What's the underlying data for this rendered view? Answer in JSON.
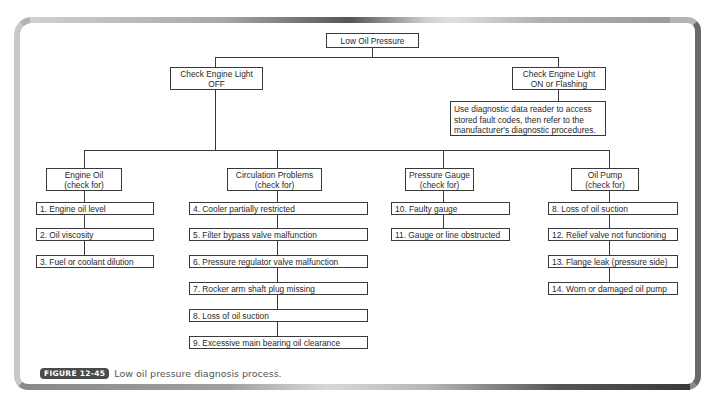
{
  "diagram": {
    "root": {
      "label": "Low Oil Pressure"
    },
    "branch_off": {
      "line1": "Check Engine Light",
      "line2": "OFF"
    },
    "branch_on": {
      "line1": "Check Engine Light",
      "line2": "ON or Flashing"
    },
    "diagnostic_note": {
      "line1": "Use diagnostic data reader to access",
      "line2": "stored fault codes, then refer to the",
      "line3": "manufacturer's diagnostic procedures."
    },
    "categories": [
      {
        "title": "Engine Oil",
        "subtitle": "(check for)",
        "items": [
          "1. Engine oil level",
          "2. Oil viscosity",
          "3. Fuel or coolant dilution"
        ]
      },
      {
        "title": "Circulation Problems",
        "subtitle": "(check for)",
        "items": [
          "4. Cooler partially restricted",
          "5. Filter bypass valve malfunction",
          "6. Pressure regulator valve malfunction",
          "7. Rocker arm shaft plug missing",
          "8. Loss of oil suction",
          "9. Excessive main bearing oil clearance"
        ]
      },
      {
        "title": "Pressure Gauge",
        "subtitle": "(check for)",
        "items": [
          "10. Faulty gauge",
          "11. Gauge or line obstructed"
        ]
      },
      {
        "title": "Oil Pump",
        "subtitle": "(check for)",
        "items": [
          "8. Loss of oil suction",
          "12. Relief valve not functioning",
          "13. Flange leak (pressure side)",
          "14. Worn or damaged oil pump"
        ]
      }
    ]
  },
  "caption": {
    "figure_label": "FIGURE 12-45",
    "text": "Low oil pressure diagnosis process."
  },
  "colors": {
    "line": "#3a3a3a",
    "badge": "#4a4a4a",
    "frame_light": "#c8c8c8",
    "frame_dark": "#555555"
  }
}
